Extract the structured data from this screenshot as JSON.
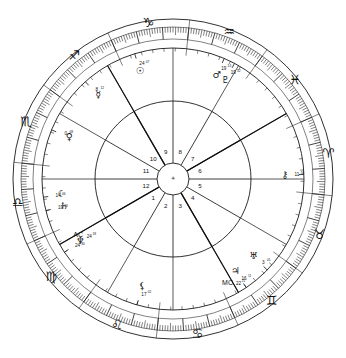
{
  "chart": {
    "center_marker": "✳",
    "geometry": {
      "cx": 173,
      "cy": 179,
      "r_outer": 160,
      "r_tickband_outer": 152,
      "r_tickband_inner": 140,
      "r_sign_band_inner": 131,
      "r_planet_ring": 118,
      "r_inner_circle": 78,
      "r_hub": 16,
      "ascendant_offset_deg": 204
    },
    "zodiac_signs": [
      {
        "name": "Aries",
        "glyph": "♈",
        "start_deg": 0
      },
      {
        "name": "Taurus",
        "glyph": "♉",
        "start_deg": 30
      },
      {
        "name": "Gemini",
        "glyph": "♊",
        "start_deg": 60
      },
      {
        "name": "Cancer",
        "glyph": "♋",
        "start_deg": 90
      },
      {
        "name": "Leo",
        "glyph": "♌",
        "start_deg": 120
      },
      {
        "name": "Virgo",
        "glyph": "♍",
        "start_deg": 150
      },
      {
        "name": "Libra",
        "glyph": "♎",
        "start_deg": 180
      },
      {
        "name": "Scorpio",
        "glyph": "♏",
        "start_deg": 210
      },
      {
        "name": "Sagittarius",
        "glyph": "♐",
        "start_deg": 240
      },
      {
        "name": "Capricorn",
        "glyph": "♑",
        "start_deg": 270
      },
      {
        "name": "Aquarius",
        "glyph": "♒",
        "start_deg": 300
      },
      {
        "name": "Pisces",
        "glyph": "♓",
        "start_deg": 330
      }
    ],
    "houses": [
      {
        "number": "1",
        "cusp_deg": 174
      },
      {
        "number": "2",
        "cusp_deg": 144
      },
      {
        "number": "3",
        "cusp_deg": 114
      },
      {
        "number": "4",
        "cusp_deg": 84
      },
      {
        "number": "5",
        "cusp_deg": 54
      },
      {
        "number": "6",
        "cusp_deg": 24
      },
      {
        "number": "7",
        "cusp_deg": 354
      },
      {
        "number": "8",
        "cusp_deg": 324
      },
      {
        "number": "9",
        "cusp_deg": 294
      },
      {
        "number": "10",
        "cusp_deg": 264
      },
      {
        "number": "11",
        "cusp_deg": 234
      },
      {
        "number": "12",
        "cusp_deg": 204
      }
    ],
    "angles": [
      {
        "name": "Ascendant",
        "label": "AC",
        "degree": "24",
        "minute": "18",
        "lon_deg": 174
      },
      {
        "name": "Midheaven",
        "label": "MC",
        "degree": "22",
        "minute": "21",
        "lon_deg": 84
      }
    ],
    "planets": [
      {
        "name": "Jupiter",
        "glyph": "♃",
        "degree": "16",
        "minute": "11",
        "lon_deg": 80
      },
      {
        "name": "Uranus",
        "glyph": "♅",
        "degree": "3",
        "minute": "01",
        "lon_deg": 68
      },
      {
        "name": "Chiron",
        "glyph": "⚷",
        "degree": "11",
        "minute": "34",
        "lon_deg": 22
      },
      {
        "name": "Pluto",
        "glyph": "♇",
        "degree": "19",
        "minute": "32",
        "lon_deg": 322
      },
      {
        "name": "Mars",
        "glyph": "♂",
        "degree": "19",
        "minute": "14",
        "lon_deg": 317
      },
      {
        "name": "Sun",
        "glyph": "☉",
        "degree": "24",
        "minute": "07",
        "lon_deg": 277
      },
      {
        "name": "Mercury",
        "glyph": "☿",
        "degree": "8",
        "minute": "12",
        "lon_deg": 252
      },
      {
        "name": "Venus",
        "glyph": "♀",
        "degree": "0",
        "minute": "08",
        "lon_deg": 226
      },
      {
        "name": "Saturn",
        "glyph": "♄",
        "degree": "19",
        "minute": "09",
        "lon_deg": 190
      },
      {
        "name": "Moon",
        "glyph": "☾",
        "degree": "14",
        "minute": "06",
        "lon_deg": 196
      },
      {
        "name": "Neptune",
        "glyph": "♆",
        "degree": "24",
        "minute": "30",
        "lon_deg": 170
      },
      {
        "name": "Lilith",
        "glyph": "⚸",
        "degree": "17",
        "minute": "02",
        "lon_deg": 130
      }
    ],
    "colors": {
      "ink": "#1a1a1a",
      "background": "#ffffff"
    }
  }
}
